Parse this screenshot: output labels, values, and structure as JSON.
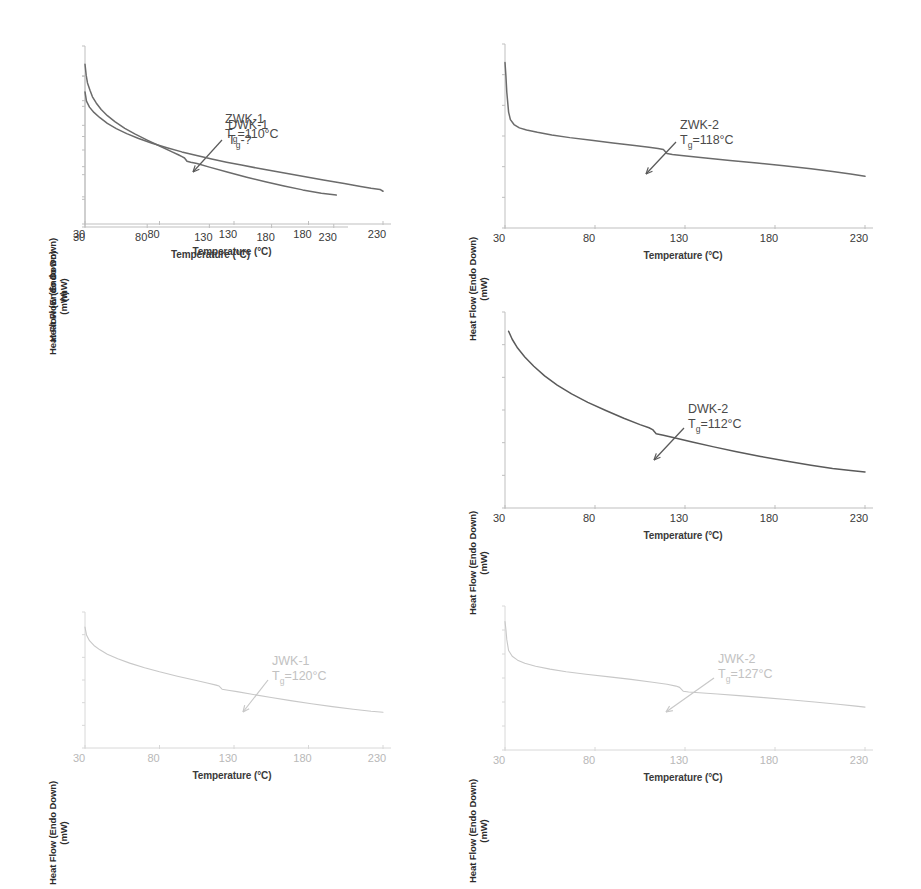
{
  "figure": {
    "layout": "2 columns x 3 rows of DSC thermograms",
    "background": "#ffffff"
  },
  "axis_titles": {
    "y_line1": "Heat Flow (Endo Down)",
    "y_line2": "(mW)",
    "x": "Temperature (°C)"
  },
  "ticks": {
    "x": [
      "30",
      "80",
      "130",
      "180",
      "230"
    ]
  },
  "colors": {
    "curve_dark": "#6b6b6b",
    "curve_darker": "#5a5a5a",
    "curve_faded": "#c8c8c8",
    "axis": "#bfbfbf",
    "text": "#3a3a3a",
    "text_faded": "#c2c2c2"
  },
  "chart_data": [
    {
      "type": "line",
      "id": "zwk-1",
      "sample": "ZWK-1",
      "tg_label": "T",
      "tg_sub": "g",
      "tg_value": "=110°C",
      "tg_celsius": 110,
      "annotation": "ZWK-1 / Tg=110°C",
      "has_arrow": true,
      "faded": false,
      "xlabel": "Temperature (°C)",
      "ylabel": "Heat Flow (Endo Down) (mW)",
      "xlim": [
        30,
        235
      ],
      "ylim": [
        0,
        1
      ],
      "xticks": [
        30,
        80,
        130,
        180,
        230
      ],
      "grid": false,
      "x": [
        30,
        31,
        32,
        34,
        36,
        39,
        43,
        48,
        54,
        62,
        70,
        80,
        90,
        100,
        105,
        108,
        110,
        112,
        115,
        120,
        130,
        145,
        160,
        175,
        190,
        205,
        220,
        232
      ],
      "y": [
        1.0,
        0.93,
        0.885,
        0.84,
        0.8,
        0.762,
        0.722,
        0.684,
        0.648,
        0.606,
        0.572,
        0.534,
        0.498,
        0.462,
        0.444,
        0.432,
        0.424,
        0.404,
        0.398,
        0.39,
        0.368,
        0.336,
        0.306,
        0.278,
        0.252,
        0.228,
        0.208,
        0.196
      ]
    },
    {
      "type": "line",
      "id": "zwk-2",
      "sample": "ZWK-2",
      "tg_label": "T",
      "tg_sub": "g",
      "tg_value": "=118°C",
      "tg_celsius": 118,
      "annotation": "ZWK-2 / Tg=118°C",
      "has_arrow": true,
      "faded": false,
      "xlabel": "Temperature (°C)",
      "ylabel": "Heat Flow (Endo Down) (mW)",
      "xlim": [
        30,
        230
      ],
      "ylim": [
        0,
        1
      ],
      "xticks": [
        30,
        80,
        130,
        180,
        230
      ],
      "grid": false,
      "x": [
        30,
        30.5,
        31,
        32,
        33,
        35,
        38,
        42,
        48,
        56,
        66,
        78,
        90,
        102,
        110,
        115,
        118,
        120,
        123,
        128,
        140,
        155,
        170,
        185,
        200,
        212,
        222,
        230
      ],
      "y": [
        1.0,
        0.92,
        0.82,
        0.7,
        0.655,
        0.625,
        0.605,
        0.592,
        0.578,
        0.562,
        0.546,
        0.53,
        0.514,
        0.498,
        0.488,
        0.48,
        0.474,
        0.45,
        0.444,
        0.438,
        0.424,
        0.408,
        0.392,
        0.376,
        0.358,
        0.342,
        0.326,
        0.312
      ]
    },
    {
      "type": "line",
      "id": "dwk-1",
      "sample": "DWK-1",
      "tg_label": "T",
      "tg_sub": "g",
      "tg_value": "-?",
      "tg_celsius": null,
      "annotation": "DWK-1 / Tg-?",
      "has_arrow": false,
      "faded": false,
      "xlabel": "Temperature (°C)",
      "ylabel": "Heat Flow (Endo Down) (mW)",
      "xlim": [
        30,
        230
      ],
      "ylim": [
        0,
        1
      ],
      "xticks": [
        30,
        80,
        130,
        180,
        230
      ],
      "grid": false,
      "x": [
        30,
        31,
        33,
        36,
        40,
        45,
        51,
        58,
        66,
        75,
        85,
        95,
        105,
        115,
        125,
        135,
        148,
        162,
        176,
        190,
        204,
        215,
        222,
        228,
        230
      ],
      "y": [
        1.0,
        0.93,
        0.885,
        0.845,
        0.805,
        0.762,
        0.722,
        0.684,
        0.648,
        0.612,
        0.578,
        0.546,
        0.518,
        0.492,
        0.468,
        0.446,
        0.418,
        0.39,
        0.362,
        0.334,
        0.306,
        0.284,
        0.27,
        0.262,
        0.248
      ]
    },
    {
      "type": "line",
      "id": "dwk-2",
      "sample": "DWK-2",
      "tg_label": "T",
      "tg_sub": "g",
      "tg_value": "=112°C",
      "tg_celsius": 112,
      "annotation": "DWK-2 / Tg=112°C",
      "has_arrow": true,
      "faded": false,
      "xlabel": "Temperature (°C)",
      "ylabel": "Heat Flow (Endo Down) (mW)",
      "xlim": [
        30,
        230
      ],
      "ylim": [
        0,
        1
      ],
      "xticks": [
        30,
        80,
        130,
        180,
        230
      ],
      "grid": false,
      "x": [
        32,
        34,
        37,
        41,
        46,
        52,
        59,
        67,
        76,
        86,
        96,
        105,
        110,
        112,
        114,
        118,
        124,
        134,
        146,
        158,
        172,
        186,
        200,
        212,
        222,
        230
      ],
      "y": [
        1.0,
        0.955,
        0.905,
        0.855,
        0.802,
        0.748,
        0.696,
        0.646,
        0.598,
        0.552,
        0.508,
        0.472,
        0.454,
        0.444,
        0.42,
        0.412,
        0.398,
        0.374,
        0.346,
        0.32,
        0.292,
        0.266,
        0.242,
        0.224,
        0.212,
        0.204
      ]
    },
    {
      "type": "line",
      "id": "jwk-1",
      "sample": "JWK-1",
      "tg_label": "T",
      "tg_sub": "g",
      "tg_value": "=120°C",
      "tg_celsius": 120,
      "annotation": "JWK-1 / Tg=120°C",
      "has_arrow": true,
      "faded": true,
      "xlabel": "Temperature (°C)",
      "ylabel": "Heat Flow (Endo Down) (mW)",
      "xlim": [
        30,
        230
      ],
      "ylim": [
        0,
        1
      ],
      "xticks": [
        30,
        80,
        130,
        180,
        230
      ],
      "grid": false,
      "x": [
        30,
        31,
        33,
        36,
        40,
        45,
        52,
        60,
        70,
        80,
        92,
        104,
        112,
        118,
        120,
        122,
        126,
        132,
        142,
        155,
        168,
        182,
        196,
        210,
        222,
        230
      ],
      "y": [
        1.0,
        0.935,
        0.888,
        0.848,
        0.812,
        0.776,
        0.738,
        0.702,
        0.664,
        0.63,
        0.594,
        0.56,
        0.538,
        0.52,
        0.512,
        0.486,
        0.478,
        0.466,
        0.444,
        0.418,
        0.392,
        0.366,
        0.342,
        0.32,
        0.304,
        0.296
      ]
    },
    {
      "type": "line",
      "id": "jwk-2",
      "sample": "JWK-2",
      "tg_label": "T",
      "tg_sub": "g",
      "tg_value": "=127°C",
      "tg_celsius": 127,
      "annotation": "JWK-2 / Tg=127°C",
      "has_arrow": true,
      "faded": true,
      "xlabel": "Temperature (°C)",
      "ylabel": "Heat Flow (Endo Down) (mW)",
      "xlim": [
        30,
        230
      ],
      "ylim": [
        0,
        1
      ],
      "xticks": [
        30,
        80,
        130,
        180,
        230
      ],
      "grid": false,
      "x": [
        30,
        30.5,
        31,
        32,
        34,
        37,
        41,
        47,
        55,
        64,
        75,
        88,
        100,
        112,
        120,
        125,
        127,
        129,
        132,
        138,
        148,
        160,
        174,
        188,
        202,
        215,
        225,
        230
      ],
      "y": [
        1.0,
        0.94,
        0.86,
        0.775,
        0.73,
        0.7,
        0.676,
        0.652,
        0.63,
        0.61,
        0.59,
        0.57,
        0.55,
        0.528,
        0.512,
        0.498,
        0.488,
        0.458,
        0.452,
        0.446,
        0.436,
        0.424,
        0.408,
        0.392,
        0.374,
        0.356,
        0.342,
        0.334
      ]
    }
  ]
}
